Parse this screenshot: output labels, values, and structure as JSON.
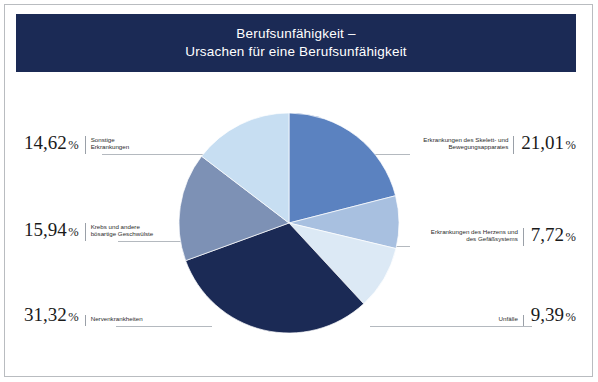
{
  "title": {
    "line1": "Berufsunfähigkeit –",
    "line2": "Ursachen für eine Berufsunfähigkeit"
  },
  "colors": {
    "banner": "#1b2a55",
    "frame": "#b9bcc0",
    "leader": "#b4b9bf",
    "background": "#ffffff"
  },
  "chart_data": {
    "type": "pie",
    "title": "Berufsunfähigkeit – Ursachen für eine Berufsunfähigkeit",
    "xlabel": "",
    "ylabel": "",
    "legend_position": "callout-labels",
    "grid": false,
    "unit": "%",
    "decimal_separator": ",",
    "start_angle_deg": 0,
    "direction": "clockwise",
    "categories": [
      "Erkrankungen des Skelett- und Bewegungsapparates",
      "Erkrankungen des Herzens und des Gefäßsystems",
      "Unfälle",
      "Nervenkrankheiten",
      "Krebs und andere bösartige Geschwülste",
      "Sonstige Erkrankungen"
    ],
    "values": [
      21.01,
      7.72,
      9.39,
      31.32,
      15.94,
      14.62
    ],
    "slice_colors": [
      "#5b82c0",
      "#a8c0e0",
      "#dce9f5",
      "#1b2a55",
      "#7d91b5",
      "#c7def2"
    ],
    "total": 100.0
  },
  "callouts": {
    "skelett": {
      "pct": "21,01",
      "symbol": "%",
      "cat_line1": "Erkrankungen des Skelett- und",
      "cat_line2": "Bewegungsapparates"
    },
    "herz": {
      "pct": "7,72",
      "symbol": "%",
      "cat_line1": "Erkrankungen des Herzens und",
      "cat_line2": "des Gefäßsystems"
    },
    "unfaelle": {
      "pct": "9,39",
      "symbol": "%",
      "cat_line1": "Unfälle",
      "cat_line2": ""
    },
    "nerven": {
      "pct": "31,32",
      "symbol": "%",
      "cat_line1": "Nervenkrankheiten",
      "cat_line2": ""
    },
    "krebs": {
      "pct": "15,94",
      "symbol": "%",
      "cat_line1": "Krebs und andere",
      "cat_line2": "bösartige Geschwülste"
    },
    "sonstige": {
      "pct": "14,62",
      "symbol": "%",
      "cat_line1": "Sonstige",
      "cat_line2": "Erkrankungen"
    }
  }
}
